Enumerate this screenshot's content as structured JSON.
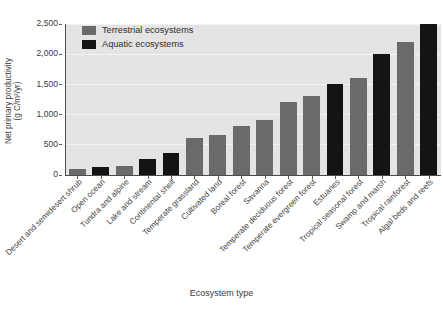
{
  "chart_data": {
    "type": "bar",
    "title": "",
    "xlabel": "Ecosystem type",
    "ylabel_line1": "Net primary productivity",
    "ylabel_line2": "(g C/m²/yr)",
    "ylim": [
      0,
      2500
    ],
    "yticks": [
      0,
      500,
      1000,
      1500,
      2000,
      2500
    ],
    "ytick_labels": [
      "0",
      "500",
      "1,000",
      "1,500",
      "2,000",
      "2,500"
    ],
    "grid": true,
    "grid_axis": "y",
    "legend_position": "top-left",
    "legend": [
      {
        "label": "Terrestrial ecosystems",
        "key": "terrestrial",
        "color": "#6a6a6a"
      },
      {
        "label": "Aquatic ecosystems",
        "key": "aquatic",
        "color": "#141414"
      }
    ],
    "categories": [
      "Desert and semidesert shrub",
      "Open ocean",
      "Tundra and alpine",
      "Lake and stream",
      "Continental shelf",
      "Temperate grassland",
      "Cultivated land",
      "Boreal forest",
      "Savanna",
      "Temperate deciduous forest",
      "Temperate evergreen forest",
      "Estuaries",
      "Tropical seasonal forest",
      "Swamp and marsh",
      "Tropical rainforest",
      "Algal beds and reefs"
    ],
    "values": [
      90,
      125,
      140,
      250,
      360,
      600,
      660,
      810,
      900,
      1200,
      1300,
      1500,
      1600,
      2000,
      2200,
      2500
    ],
    "groups": [
      "terrestrial",
      "aquatic",
      "terrestrial",
      "aquatic",
      "aquatic",
      "terrestrial",
      "terrestrial",
      "terrestrial",
      "terrestrial",
      "terrestrial",
      "terrestrial",
      "aquatic",
      "terrestrial",
      "aquatic",
      "terrestrial",
      "aquatic"
    ],
    "colors": {
      "terrestrial": "#6a6a6a",
      "aquatic": "#141414",
      "plot_background": "#e4e4e4",
      "gridline": "#f4f4f4",
      "axis": "#4a4a4a",
      "page_background": "#ffffff"
    }
  }
}
